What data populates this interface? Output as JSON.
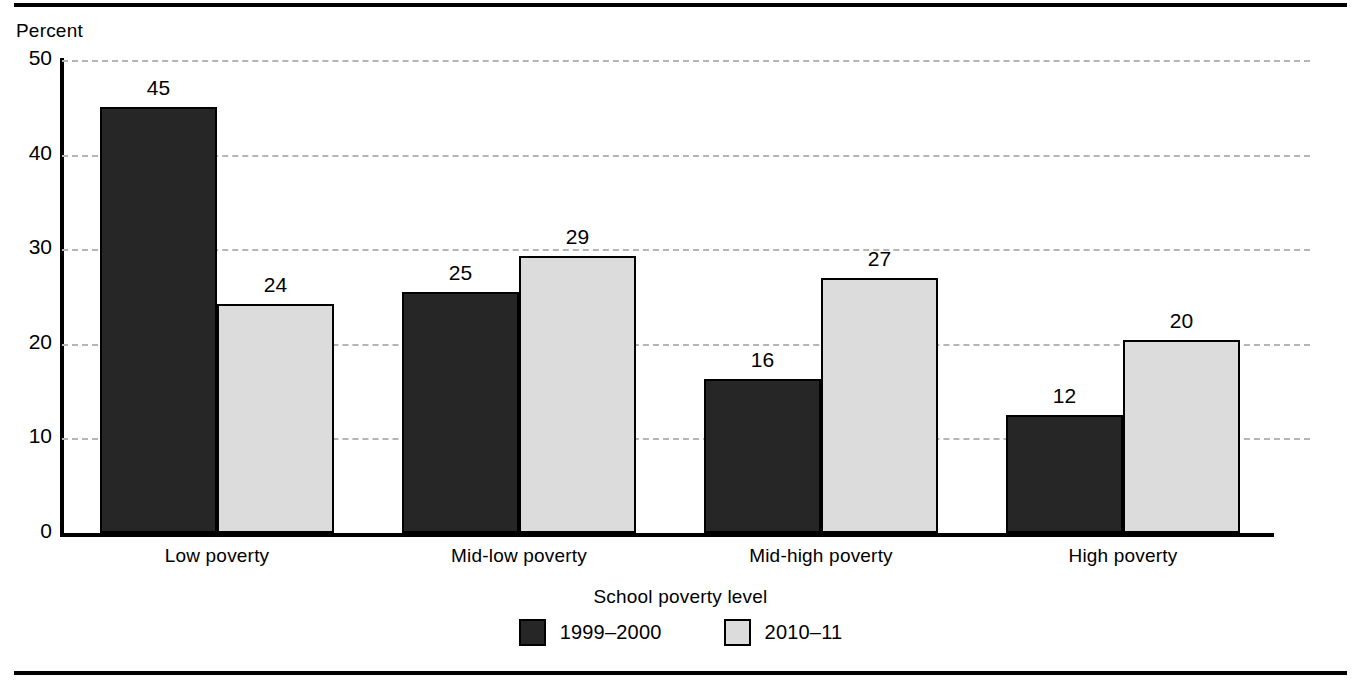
{
  "chart_data": {
    "type": "bar",
    "title": "",
    "xlabel": "School poverty level",
    "ylabel": "Percent",
    "categories": [
      "Low poverty",
      "Mid-low poverty",
      "Mid-high poverty",
      "High poverty"
    ],
    "series": [
      {
        "name": "1999–2000",
        "color": "#262626",
        "values": [
          45.0,
          25.5,
          16.3,
          12.5
        ],
        "labels": [
          "45",
          "25",
          "16",
          "12"
        ]
      },
      {
        "name": "2010–11",
        "color": "#dcdcdc",
        "values": [
          24.2,
          29.3,
          27.0,
          20.4
        ],
        "labels": [
          "24",
          "29",
          "27",
          "20"
        ]
      }
    ],
    "ylim": [
      0,
      50
    ],
    "yticks": [
      0,
      10,
      20,
      30,
      40,
      50
    ],
    "ytick_labels": [
      "0",
      "10",
      "20",
      "30",
      "40",
      "50"
    ],
    "grid": true,
    "grid_style": "dashed",
    "grid_color": "#b5b5b5",
    "legend_position": "bottom-center"
  },
  "axis": {
    "y_title": "Percent",
    "x_title": "School poverty level"
  }
}
